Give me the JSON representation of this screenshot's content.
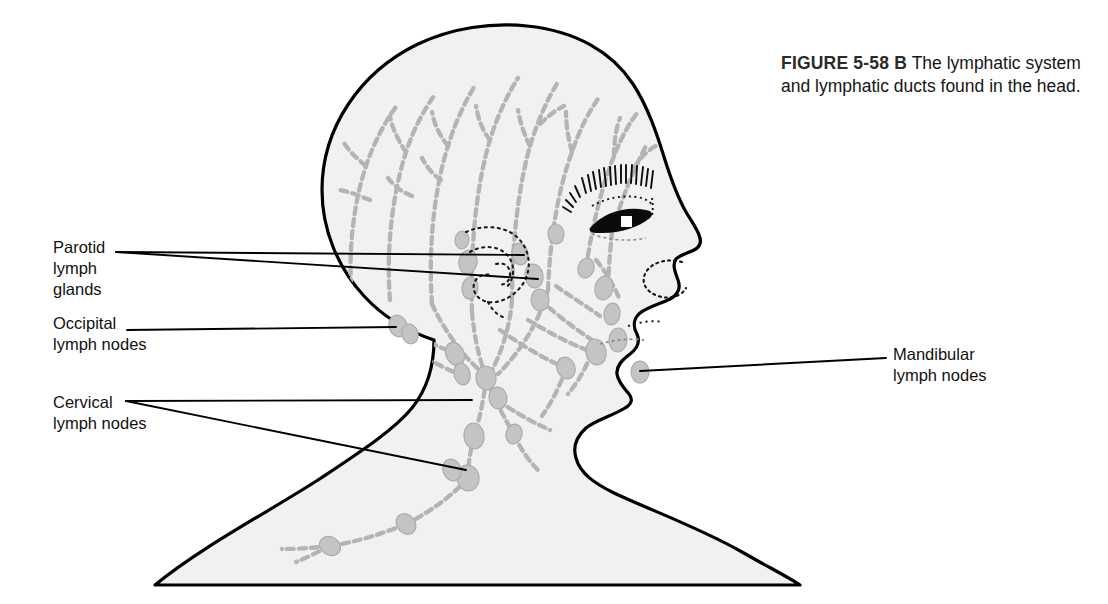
{
  "figure": {
    "tag": "FIGURE 5-58 B",
    "caption": "The lymphatic system and lymphatic ducts found in the head."
  },
  "colors": {
    "background": "#ffffff",
    "body_fill": "#f1f1f1",
    "body_outline": "#000000",
    "lymph_vessel": "#b3b3b3",
    "lymph_node": "#c3c3c3",
    "lymph_node_stroke": "#a8a8a8",
    "dotted_detail": "#1a1a1a",
    "label_text": "#111111",
    "leader_line": "#000000"
  },
  "labels": [
    {
      "id": "parotid",
      "text": "Parotid\nlymph\nglands",
      "side": "left",
      "leader_count": 2
    },
    {
      "id": "occipital",
      "text": "Occipital\nlymph nodes",
      "side": "left",
      "leader_count": 1
    },
    {
      "id": "cervical",
      "text": "Cervical\nlymph nodes",
      "side": "left",
      "leader_count": 2
    },
    {
      "id": "mandibular",
      "text": "Mandibular\nlymph nodes",
      "side": "right",
      "leader_count": 1
    }
  ],
  "anatomy_parts": [
    "cranium",
    "eyebrow",
    "eye",
    "nose",
    "nostril",
    "lips",
    "chin",
    "jaw",
    "ear (parotid region)",
    "neck",
    "shoulders"
  ]
}
